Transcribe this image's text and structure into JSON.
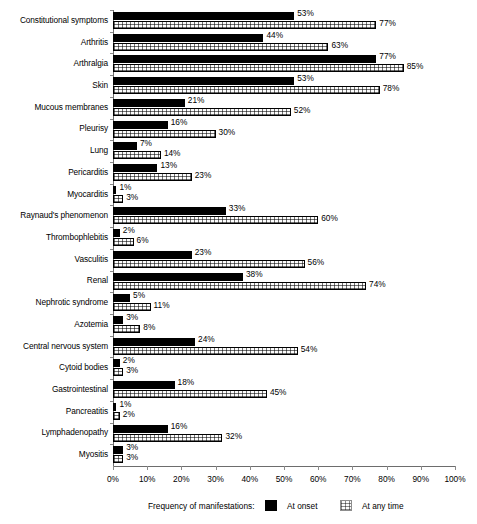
{
  "chart_data": {
    "type": "bar",
    "orientation": "horizontal",
    "title": "",
    "xlabel": "",
    "ylabel": "",
    "xlim": [
      0,
      100
    ],
    "xticks": [
      "0%",
      "10%",
      "20%",
      "30%",
      "40%",
      "50%",
      "60%",
      "70%",
      "80%",
      "90%",
      "100%"
    ],
    "grid": false,
    "legend_position": "bottom",
    "legend_title": "Frequency of manifestations:",
    "categories": [
      "Constitutional symptoms",
      "Arthritis",
      "Arthralgia",
      "Skin",
      "Mucous membranes",
      "Pleurisy",
      "Lung",
      "Pericarditis",
      "Myocarditis",
      "Raynaud's phenomenon",
      "Thrombophlebitis",
      "Vasculitis",
      "Renal",
      "Nephrotic syndrome",
      "Azotemia",
      "Central nervous system",
      "Cytoid bodies",
      "Gastrointestinal",
      "Pancreatitis",
      "Lymphadenopathy",
      "Myositis"
    ],
    "series": [
      {
        "name": "At onset",
        "color": "#000000",
        "values": [
          53,
          44,
          77,
          53,
          21,
          16,
          7,
          13,
          1,
          33,
          2,
          23,
          38,
          5,
          3,
          24,
          2,
          18,
          1,
          16,
          3
        ],
        "labels": [
          "53%",
          "44%",
          "77%",
          "53%",
          "21%",
          "16%",
          "7%",
          "13%",
          "1%",
          "33%",
          "2%",
          "23%",
          "38%",
          "5%",
          "3%",
          "24%",
          "2%",
          "18%",
          "1%",
          "16%",
          "3%"
        ]
      },
      {
        "name": "At any time",
        "color": "#fcfcfc",
        "values": [
          77,
          63,
          85,
          78,
          52,
          30,
          14,
          23,
          3,
          60,
          6,
          56,
          74,
          11,
          8,
          54,
          3,
          45,
          2,
          32,
          3
        ],
        "labels": [
          "77%",
          "63%",
          "85%",
          "78%",
          "52%",
          "30%",
          "14%",
          "23%",
          "3%",
          "60%",
          "6%",
          "56%",
          "74%",
          "11%",
          "8%",
          "54%",
          "3%",
          "45%",
          "2%",
          "32%",
          "3%"
        ]
      }
    ]
  },
  "legend": {
    "title": "Frequency of manifestations:",
    "items": [
      {
        "label": "At onset",
        "swatch": "solid-black-swatch"
      },
      {
        "label": "At any time",
        "swatch": "dotted-pattern-swatch"
      }
    ]
  }
}
